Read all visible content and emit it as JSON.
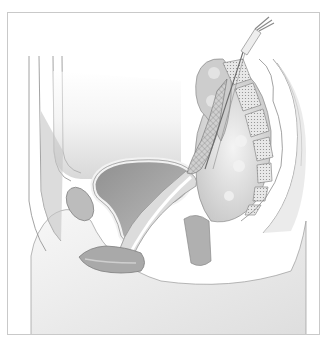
{
  "figure": {
    "type": "medical-illustration",
    "view": "sagittal section of female pelvis",
    "caption": "",
    "style": "grayscale",
    "colors": {
      "frame_border": "#c9c9c9",
      "background": "#ffffff",
      "tissue_light": "#ececec",
      "tissue_mid": "#cfcfcf",
      "tissue_dark": "#9a9a9a",
      "outline": "#8c8c8c"
    },
    "structures": [
      {
        "name": "abdominal-wall",
        "label": ""
      },
      {
        "name": "pubic-bone",
        "label": ""
      },
      {
        "name": "bladder",
        "label": ""
      },
      {
        "name": "urethra",
        "label": ""
      },
      {
        "name": "vagina",
        "label": ""
      },
      {
        "name": "uterus",
        "label": ""
      },
      {
        "name": "mesh-implant",
        "label": ""
      },
      {
        "name": "insertion-instrument",
        "label": ""
      },
      {
        "name": "rectum",
        "label": ""
      },
      {
        "name": "sacrum-coccyx",
        "label": ""
      },
      {
        "name": "perineum",
        "label": ""
      }
    ]
  }
}
